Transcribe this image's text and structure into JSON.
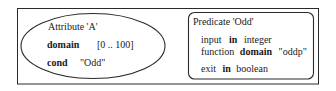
{
  "diagram": {
    "outer_frame": {
      "x": 17,
      "y": 8,
      "width": 302,
      "height": 76,
      "stroke": "#2a2a2a"
    },
    "attribute_node": {
      "shape": "ellipse",
      "cx": 93,
      "cy": 46,
      "rx": 72,
      "ry": 32,
      "stroke": "#2a2a2a",
      "title": "Attribute 'A'",
      "rows": [
        {
          "keyword": "domain",
          "value": "[0 .. 100]"
        },
        {
          "keyword": "cond",
          "value": "\"Odd\""
        }
      ]
    },
    "predicate_node": {
      "shape": "rounded-rectangle",
      "x": 188,
      "y": 12,
      "width": 126,
      "height": 67,
      "corner_radius": 6,
      "stroke": "#2a2a2a",
      "title": "Predicate 'Odd'",
      "lines": [
        {
          "pre": "input",
          "keyword": "in",
          "post": "integer"
        },
        {
          "pre": "function",
          "keyword": "domain",
          "post": "\"oddp\""
        },
        {
          "pre": "exit",
          "keyword": "in",
          "post": "boolean"
        }
      ]
    }
  }
}
